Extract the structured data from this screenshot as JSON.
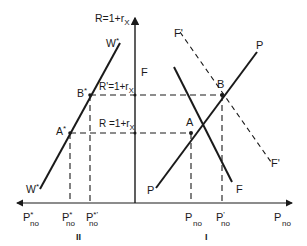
{
  "diagram": {
    "title": "",
    "colors": {
      "ink": "#1a1a1a",
      "background": "#ffffff"
    },
    "axes": {
      "vertical_label": "R=1+r",
      "vertical_label_sub": "X",
      "horizontal_right_label": "P",
      "horizontal_right_label_sub": "no",
      "horizontal_left_label": "P",
      "horizontal_left_label_sup": "*",
      "horizontal_left_label_sub": "no"
    },
    "curves": {
      "W_star_top": "W",
      "W_star_top_sup": "*",
      "W_star_bottom": "W",
      "W_star_bottom_sup": "*",
      "P_top": "P",
      "P_bottom": "P",
      "F_top": "F",
      "F_bottom": "F",
      "F_prime_top": "F'",
      "F_prime_bottom": "F'"
    },
    "points": {
      "A": "A",
      "B": "B",
      "A_star": "A",
      "A_star_sup": "*",
      "B_star": "B",
      "B_star_sup": "*"
    },
    "rate_labels": {
      "R_prime": "R'=1+r",
      "R_prime_sub": "X",
      "R_prime_sup": "'",
      "R": "R =1+r",
      "R_sub": "X"
    },
    "ticks": {
      "p_star_no": "P",
      "p_star_no_sup": "*",
      "p_star_no_sub": "no",
      "p_star_prime_no": "P",
      "p_star_prime_no_sup": "*'",
      "p_star_prime_no_sub": "no",
      "p_no": "P",
      "p_no_sub": "no",
      "p_prime_no": "P",
      "p_prime_no_sup": "'",
      "p_prime_no_sub": "no"
    },
    "regions": {
      "left": "II",
      "right": "I"
    }
  }
}
